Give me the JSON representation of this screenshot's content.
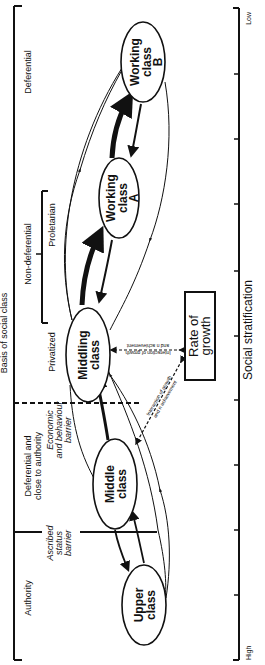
{
  "diagram": {
    "x_axis": {
      "title": "Social stratification",
      "low_label": "Low",
      "high_label": "High",
      "tick_count": 11
    },
    "basis_axis": {
      "title": "Basis of social class",
      "segments": [
        {
          "label": "Deferential"
        },
        {
          "label": "Non-deferential"
        },
        {
          "label": "Proletarian"
        },
        {
          "label": "Privatized"
        },
        {
          "label": "Deferential and close to authority"
        },
        {
          "label": "Authority"
        }
      ],
      "deferential_line1": "Deferential and",
      "deferential_line2": "close to authority"
    },
    "classes": [
      {
        "id": "working-b",
        "line1": "Working",
        "line2": "class",
        "line3": "B"
      },
      {
        "id": "working-a",
        "line1": "Working",
        "line2": "class",
        "line3": "A"
      },
      {
        "id": "middling",
        "line1": "Middling",
        "line2": "class"
      },
      {
        "id": "middle",
        "line1": "Middle",
        "line2": "class"
      },
      {
        "id": "upper",
        "line1": "Upper",
        "line2": "class"
      }
    ],
    "barriers": {
      "economic": {
        "line1": "Economic",
        "line2": "and behaviour",
        "line3": "barrier"
      },
      "ascribed": {
        "line1": "Ascribed",
        "line2": "status",
        "line3": "barrier"
      }
    },
    "growth_box": {
      "line1": "Rate of",
      "line2": "growth"
    },
    "interaction_labels": {
      "line1": "Interaction of growth",
      "line2": "and n achievement"
    }
  }
}
